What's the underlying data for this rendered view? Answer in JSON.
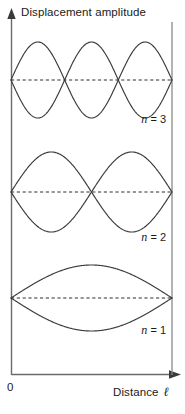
{
  "figure": {
    "title": "",
    "background_color": "#ffffff",
    "line_color": "#3a3a3a",
    "axis_color": "#6b6b6b",
    "text_color": "#1a1a1a"
  },
  "axes": {
    "y_title": "Displacement amplitude",
    "x_title": "Distance",
    "x_symbol": "ℓ",
    "origin_label": "0",
    "y_arrow_icon": "up-arrow-icon",
    "x_arrow_icon": "right-arrow-icon"
  },
  "chart_data": {
    "type": "line",
    "xlabel": "Distance ℓ",
    "ylabel": "Displacement amplitude",
    "xlim": [
      0,
      1
    ],
    "ylim": [
      -1,
      1
    ],
    "grid": false,
    "legend": "inline-right",
    "series": [
      {
        "name": "n = 3",
        "label": "n = 3",
        "mode_number": 3,
        "antinodes": 3,
        "nodes": 4,
        "harmonic": "third harmonic",
        "wavelength_fraction": "2ℓ/3",
        "envelope": "sin(3πx/ℓ)",
        "amplitude": 1.0,
        "baseline_y_px": 80,
        "amplitude_px": 38,
        "x_start_px": 11,
        "x_end_px": 172,
        "label_x_px": 166,
        "label_y_px": 120
      },
      {
        "name": "n = 2",
        "label": "n = 2",
        "mode_number": 2,
        "antinodes": 2,
        "nodes": 3,
        "harmonic": "second harmonic",
        "wavelength_fraction": "ℓ",
        "envelope": "sin(2πx/ℓ)",
        "amplitude": 1.0,
        "baseline_y_px": 192,
        "amplitude_px": 40,
        "x_start_px": 11,
        "x_end_px": 172,
        "label_x_px": 166,
        "label_y_px": 238
      },
      {
        "name": "n = 1",
        "label": "n = 1",
        "mode_number": 1,
        "antinodes": 1,
        "nodes": 2,
        "harmonic": "fundamental",
        "wavelength_fraction": "2ℓ",
        "envelope": "sin(πx/ℓ)",
        "amplitude": 1.0,
        "baseline_y_px": 298,
        "amplitude_px": 33,
        "x_start_px": 11,
        "x_end_px": 172,
        "label_x_px": 166,
        "label_y_px": 331
      }
    ]
  },
  "mode_labels": [
    {
      "var": "n",
      "eq": " = 3"
    },
    {
      "var": "n",
      "eq": " = 2"
    },
    {
      "var": "n",
      "eq": " = 1"
    }
  ]
}
